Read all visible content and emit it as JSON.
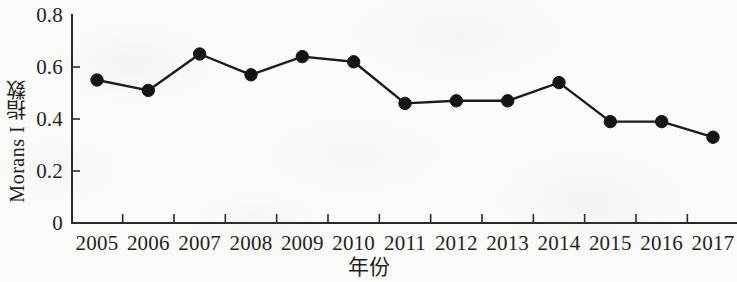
{
  "chart_data": {
    "type": "line",
    "title": "",
    "xlabel": "年份",
    "ylabel": "Morans I 指数",
    "categories": [
      "2005",
      "2006",
      "2007",
      "2008",
      "2009",
      "2010",
      "2011",
      "2012",
      "2013",
      "2014",
      "2015",
      "2016",
      "2017"
    ],
    "values": [
      0.55,
      0.51,
      0.65,
      0.57,
      0.64,
      0.62,
      0.46,
      0.47,
      0.47,
      0.54,
      0.39,
      0.39,
      0.33
    ],
    "series": [
      {
        "name": "Morans I 指数",
        "values": [
          0.55,
          0.51,
          0.65,
          0.57,
          0.64,
          0.62,
          0.46,
          0.47,
          0.47,
          0.54,
          0.39,
          0.39,
          0.33
        ]
      }
    ],
    "ylim": [
      0,
      0.8
    ],
    "y_ticks": [
      "0",
      "0.2",
      "0.4",
      "0.6",
      "0.8"
    ],
    "y_tick_values": [
      0,
      0.2,
      0.4,
      0.6,
      0.8
    ],
    "x_ticks": [
      "2005",
      "2006",
      "2007",
      "2008",
      "2009",
      "2010",
      "2011",
      "2012",
      "2013",
      "2014",
      "2015",
      "2016",
      "2017"
    ],
    "grid": false,
    "legend": false,
    "legend_position": "none",
    "marker": "filled-circle",
    "line_color": "#1a1a1a",
    "marker_color": "#141414",
    "axis_color": "#2a2a2a",
    "background_color": "#fbfbf9"
  },
  "axes": {
    "y_title": "Morans I 指数",
    "x_title": "年份"
  }
}
